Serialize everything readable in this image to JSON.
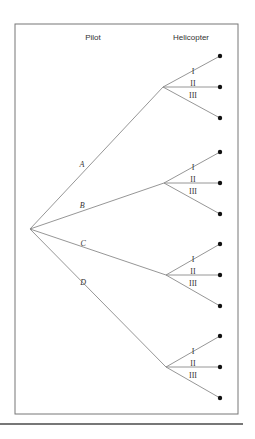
{
  "figure": {
    "headers": {
      "pilot": "Pilot",
      "helicopter": "Helicopter"
    },
    "pilots": [
      {
        "label": "A",
        "node": [
          163,
          87
        ]
      },
      {
        "label": "B",
        "node": [
          164,
          183
        ]
      },
      {
        "label": "C",
        "node": [
          166,
          275
        ]
      },
      {
        "label": "D",
        "node": [
          166,
          367
        ]
      }
    ],
    "helicopters": [
      "I",
      "II",
      "III"
    ],
    "root": [
      30,
      229
    ],
    "colors": {
      "line": "#8a8a8a",
      "text": "#333333",
      "leaf": "#111111",
      "rule": "#777777"
    }
  }
}
